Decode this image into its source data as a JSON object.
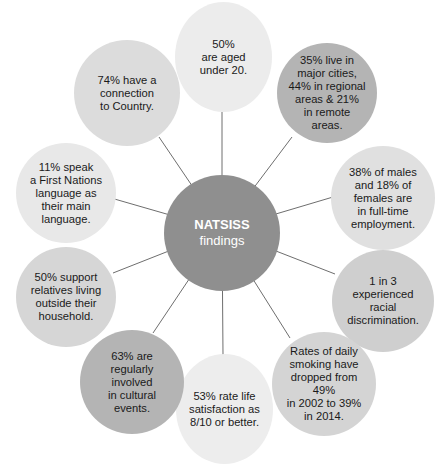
{
  "center": {
    "title": "NATSISS",
    "subtitle": "findings",
    "color": "#8f8f8f"
  },
  "bubbles": [
    {
      "id": "age",
      "text": "50%\nare aged\nunder 20.",
      "color": "#ececec"
    },
    {
      "id": "location",
      "text": "35% live in\nmajor cities,\n44% in regional\nareas & 21%\nin remote\nareas.",
      "color": "#b4b4b4"
    },
    {
      "id": "employment",
      "text": "38% of males\nand 18% of\nfemales are\nin full-time\nemployment.",
      "color": "#e0e0e0"
    },
    {
      "id": "discrimination",
      "text": "1 in 3 experienced\nracial\ndiscrimination.",
      "color": "#cfcfcf"
    },
    {
      "id": "smoking",
      "text": "Rates of daily\nsmoking have\ndropped from 49%\nin 2002 to 39%\nin 2014.",
      "color": "#d4d4d4"
    },
    {
      "id": "life-satisfaction",
      "text": "53% rate life\nsatisfaction as\n8/10 or better.",
      "color": "#ededed"
    },
    {
      "id": "cultural-events",
      "text": "63% are\nregularly involved\nin cultural\nevents.",
      "color": "#b4b4b4"
    },
    {
      "id": "support-relatives",
      "text": "50% support\nrelatives living\noutside their\nhousehold.",
      "color": "#d6d6d6"
    },
    {
      "id": "language",
      "text": "11% speak\na  First Nations\nlanguage as\ntheir main\nlanguage.",
      "color": "#e8e8e8"
    },
    {
      "id": "country",
      "text": "74% have a\nconnection\nto Country.",
      "color": "#dcdcdc"
    }
  ],
  "line_color": "#6e6e6e"
}
